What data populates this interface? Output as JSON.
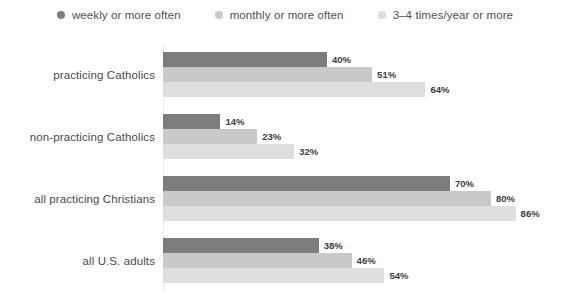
{
  "legend": {
    "position": "top-center",
    "items": [
      {
        "label": "weekly or more often",
        "icon": "legend-dot-icon",
        "color": "#7d7d7d"
      },
      {
        "label": "monthly or more often",
        "icon": "legend-dot-icon",
        "color": "#c9c9c9"
      },
      {
        "label": "3–4 times/year or more",
        "icon": "legend-dot-icon",
        "color": "#dedede"
      }
    ]
  },
  "chart_data": {
    "type": "bar",
    "orientation": "horizontal",
    "title": "",
    "subtitle": "",
    "xlabel": "",
    "ylabel": "",
    "xlim": [
      0,
      100
    ],
    "grid": false,
    "legend_position": "top-center",
    "value_suffix": "%",
    "categories": [
      "practicing Catholics",
      "non-practicing Catholics",
      "all practicing Christians",
      "all U.S. adults"
    ],
    "series": [
      {
        "name": "weekly or more often",
        "color": "#7d7d7d",
        "values": [
          40,
          14,
          70,
          38
        ]
      },
      {
        "name": "monthly or more often",
        "color": "#c9c9c9",
        "values": [
          51,
          23,
          80,
          46
        ]
      },
      {
        "name": "3–4 times/year or more",
        "color": "#dedede",
        "values": [
          64,
          32,
          86,
          54
        ]
      }
    ],
    "value_labels": [
      [
        "40%",
        "51%",
        "64%"
      ],
      [
        "14%",
        "23%",
        "32%"
      ],
      [
        "70%",
        "80%",
        "86%"
      ],
      [
        "38%",
        "46%",
        "54%"
      ]
    ]
  },
  "axis": {
    "baseline_color": "#ececec"
  }
}
